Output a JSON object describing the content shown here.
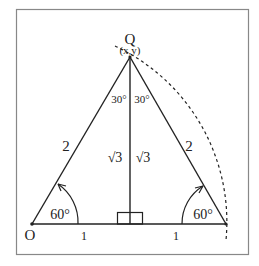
{
  "diagram": {
    "vertex_labels": {
      "apex": "Q",
      "apex_coords": "(x,y)",
      "origin": "O"
    },
    "side_labels": {
      "left_hypotenuse": "2",
      "right_hypotenuse": "2",
      "left_base": "1",
      "right_base": "1",
      "height_left": "√3",
      "height_right": "√3"
    },
    "angle_labels": {
      "apex_left": "30°",
      "apex_right": "30°",
      "base_left": "60°",
      "base_right": "60°"
    },
    "colors": {
      "line": "#222222",
      "border": "#888888",
      "background": "#ffffff"
    }
  }
}
